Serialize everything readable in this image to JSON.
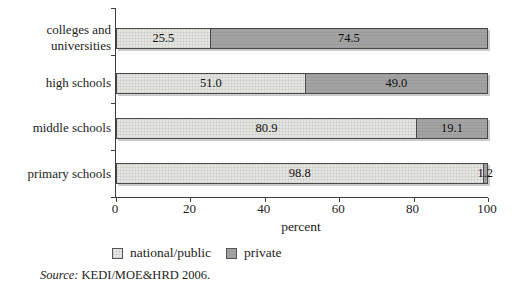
{
  "chart_data": {
    "type": "bar",
    "orientation": "horizontal",
    "stacked": true,
    "title": "",
    "xlabel": "percent",
    "xlim": [
      0,
      100
    ],
    "x_ticks": [
      "0",
      "20",
      "40",
      "60",
      "80",
      "100"
    ],
    "grid": false,
    "legend_position": "bottom",
    "categories": [
      "colleges and universities",
      "high schools",
      "middle schools",
      "primary schools"
    ],
    "series": [
      {
        "name": "national/public",
        "color": "#e5e5e1",
        "values": [
          25.5,
          51.0,
          80.9,
          98.8
        ]
      },
      {
        "name": "private",
        "color": "#a3a3a3",
        "values": [
          74.5,
          49.0,
          19.1,
          1.2
        ]
      }
    ],
    "value_labels": [
      [
        "25.5",
        "74.5"
      ],
      [
        "51.0",
        "49.0"
      ],
      [
        "80.9",
        "19.1"
      ],
      [
        "98.8",
        "1.2"
      ]
    ]
  },
  "source": {
    "label": "Source:",
    "text": " KEDI/MOE&HRD 2006."
  }
}
